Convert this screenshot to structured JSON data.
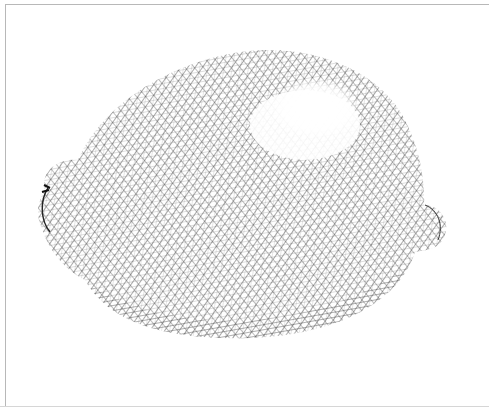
{
  "image": {
    "subject": "lemon",
    "style": "pen-and-ink crosshatching",
    "ink_color": "#222222",
    "paper_color": "#ffffff",
    "frame_color": "#b8b8b8"
  }
}
